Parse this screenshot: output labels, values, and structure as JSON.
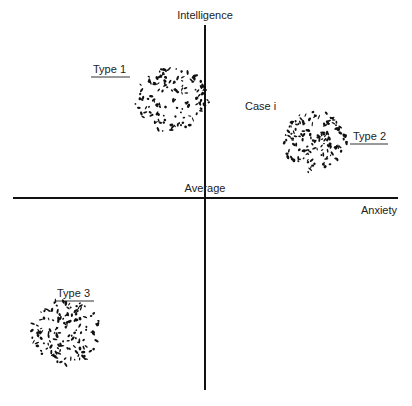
{
  "diagram": {
    "y_axis_label": "Intelligence",
    "x_axis_label": "Anxiety",
    "origin_label": "Average",
    "case_label": "Case i",
    "clusters": [
      {
        "name": "Type 1",
        "quadrant": "upper-left (straddling intelligence axis)",
        "anxiety": "slightly below average",
        "intelligence": "above average"
      },
      {
        "name": "Type 2",
        "quadrant": "upper-right",
        "anxiety": "above average",
        "intelligence": "slightly above average"
      },
      {
        "name": "Type 3",
        "quadrant": "lower-left",
        "anxiety": "below average",
        "intelligence": "below average"
      }
    ],
    "colors": {
      "ink": "#111111",
      "background": "#ffffff"
    }
  }
}
